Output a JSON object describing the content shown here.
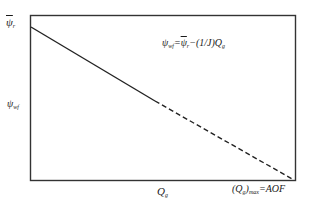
{
  "diagram": {
    "type": "ipr-straight-line",
    "frame_color": "#333333",
    "line_color": "#222222",
    "labels": {
      "y_top": "ψ̄r",
      "y_top_symbol": "ψ",
      "y_top_sub": "r",
      "y_axis": "ψwf",
      "y_axis_symbol": "ψ",
      "y_axis_sub": "wf",
      "equation": "ψwf = ψ̄r − (1/J) Qg",
      "equation_lhs_symbol": "ψ",
      "equation_lhs_sub": "wf",
      "equation_eq": "=",
      "equation_rhs_symbol": "ψ",
      "equation_rhs_sub": "r",
      "equation_minus": "−",
      "equation_frac": "(1/J)",
      "equation_q": "Q",
      "equation_q_sub": "g",
      "x_axis": "Qg",
      "x_axis_symbol": "Q",
      "x_axis_sub": "g",
      "x_max": "(Qg)max = AOF",
      "x_max_open": "(Q",
      "x_max_sub_g": "g",
      "x_max_close": ")",
      "x_max_sub_max": "max",
      "x_max_rhs": "=AOF"
    },
    "segments": [
      {
        "name": "solid",
        "style": "solid"
      },
      {
        "name": "extrapolated",
        "style": "dashed"
      }
    ]
  }
}
